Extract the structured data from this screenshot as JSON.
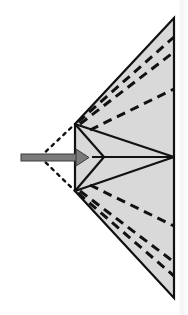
{
  "diagram": {
    "type": "folding-diagram",
    "colors": {
      "background": "#ffffff",
      "fill": "#d9d9d9",
      "stroke": "#111111",
      "arrow": "#7a7a7a",
      "arrow_outline": "#3a3a3a"
    },
    "shape": {
      "top_apex": [
        174,
        18
      ],
      "bottom_apex": [
        174,
        298
      ],
      "upper_left_vertex": [
        75,
        124
      ],
      "lower_left_vertex": [
        75,
        191
      ],
      "right_center": [
        174,
        157
      ],
      "inner_point": [
        104,
        157
      ]
    },
    "dashed_crease_endpoints_upper": [
      [
        174,
        37
      ],
      [
        174,
        52
      ],
      [
        174,
        89
      ]
    ],
    "dashed_crease_endpoints_lower": [
      [
        174,
        226
      ],
      [
        174,
        262
      ],
      [
        174,
        276
      ]
    ],
    "dotted_extension_origin": [
      40,
      157
    ],
    "arrow": {
      "from": [
        21,
        157
      ],
      "to": [
        88,
        157
      ],
      "direction": "right"
    }
  }
}
